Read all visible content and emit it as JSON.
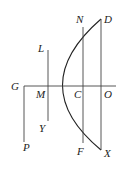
{
  "figure": {
    "type": "parabola-geometry-diagram",
    "colors": {
      "curve": "#222222",
      "lines": "#444444",
      "labels": "#222222",
      "background": "#ffffff"
    },
    "labels": {
      "D": "D",
      "N": "N",
      "L": "L",
      "G": "G",
      "M": "M",
      "C": "C",
      "O": "O",
      "Y": "Y",
      "F": "F",
      "X": "X",
      "P": "P"
    },
    "segments": [
      {
        "name": "axis",
        "from": "G",
        "to": "O"
      },
      {
        "name": "ordinate-LY",
        "from": "L",
        "to": "Y",
        "through": "M"
      },
      {
        "name": "ordinate-NF",
        "from": "N",
        "to": "F",
        "through": "C"
      },
      {
        "name": "ordinate-DX",
        "from": "D",
        "to": "X",
        "through": "O"
      },
      {
        "name": "line-GP",
        "from": "G",
        "to": "P"
      }
    ],
    "curve": {
      "name": "parabola",
      "vertex": "G",
      "points": [
        "D",
        "N",
        "L",
        "G",
        "Y",
        "F",
        "X"
      ]
    }
  }
}
